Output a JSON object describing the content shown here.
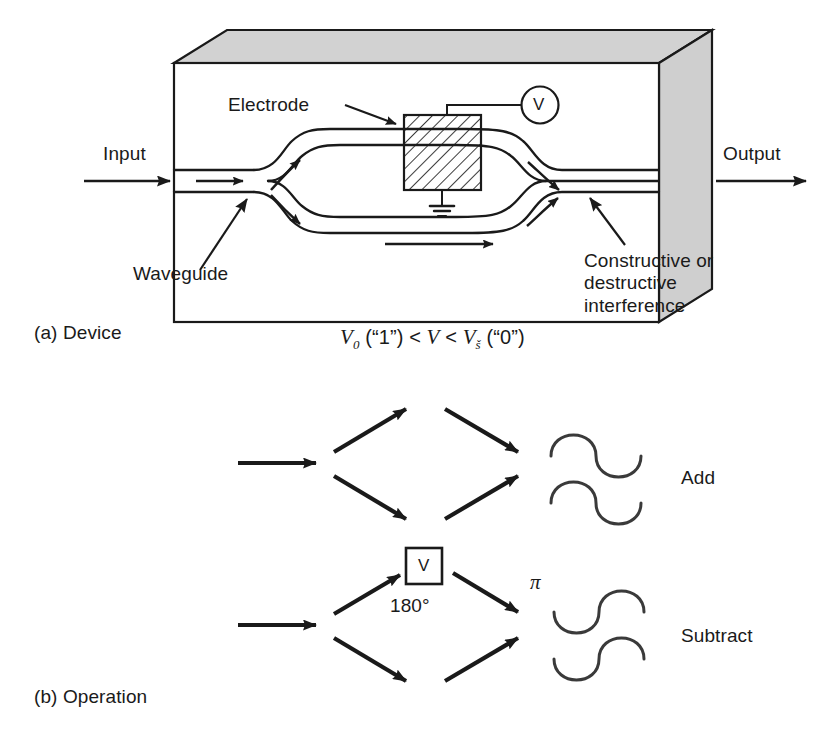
{
  "figure": {
    "panels": [
      {
        "id": "a",
        "caption": "(a) Device"
      },
      {
        "id": "b",
        "caption": "(b) Operation"
      }
    ]
  },
  "device": {
    "caption": "(a) Device",
    "input_label": "Input",
    "output_label": "Output",
    "electrode_label": "Electrode",
    "waveguide_label": "Waveguide",
    "interference_label": "Constructive or destructive interference",
    "meter_label": "V",
    "formula": {
      "full_text": "V0 (“1”) < V < Vš (“0”)",
      "v_zero": "V",
      "v_zero_sub": "0",
      "state_one": "(“1”)",
      "less_than_1": "<",
      "v_mid": "V",
      "less_than_2": "<",
      "v_pi": "V",
      "v_pi_sub": "š",
      "state_zero": "(“0”)"
    },
    "colors": {
      "substrate_top": "#d2d2d2",
      "substrate_side": "#cfcfcf",
      "line": "#1a1a1a",
      "background": "#ffffff"
    }
  },
  "operation": {
    "caption": "(b) Operation",
    "add_label": "Add",
    "subtract_label": "Subtract",
    "phase_box_letter": "V",
    "phase_degrees": "180°",
    "phase_pi": "π"
  }
}
